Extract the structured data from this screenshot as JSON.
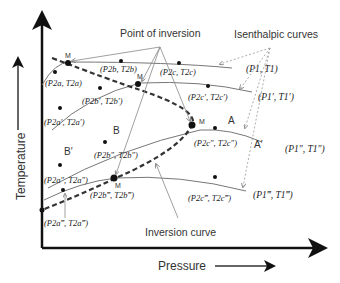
{
  "axes": {
    "x_label": "Pressure",
    "y_label": "Temperature"
  },
  "annotations": {
    "point_of_inversion": "Point of inversion",
    "isenthalpic_curves": "Isenthalpic curves",
    "inversion_curve": "Inversion curve"
  },
  "region_labels": {
    "A": "A",
    "A_prime": "A′",
    "B": "B",
    "B_prime": "B′",
    "M": "M"
  },
  "initial_states": [
    {
      "P": "P1",
      "T": "T1",
      "text": "(P1, T1)"
    },
    {
      "P": "P1′",
      "T": "T1′",
      "text": "(P1′, T1′)"
    },
    {
      "P": "P1″",
      "T": "T1″",
      "text": "(P1″, T1″)"
    },
    {
      "P": "P1‴",
      "T": "T1‴",
      "text": "(P1‴, T1‴)"
    }
  ],
  "final_states": [
    {
      "text": "(P2a, T2a)"
    },
    {
      "text": "(P2b, T2b)"
    },
    {
      "text": "(P2c, T2c)"
    },
    {
      "text": "(P2a′, T2a′)"
    },
    {
      "text": "(P2b′, T2b′)"
    },
    {
      "text": "(P2c′, T2c′)"
    },
    {
      "text": "(P2a″, T2a″)"
    },
    {
      "text": "(P2b″, T2b″)"
    },
    {
      "text": "(P2c″, T2c″)"
    },
    {
      "text": "(P2a‴, T2a‴)"
    },
    {
      "text": "(P2b‴, T2b‴)"
    },
    {
      "text": "(P2c‴, T2c‴)"
    }
  ]
}
